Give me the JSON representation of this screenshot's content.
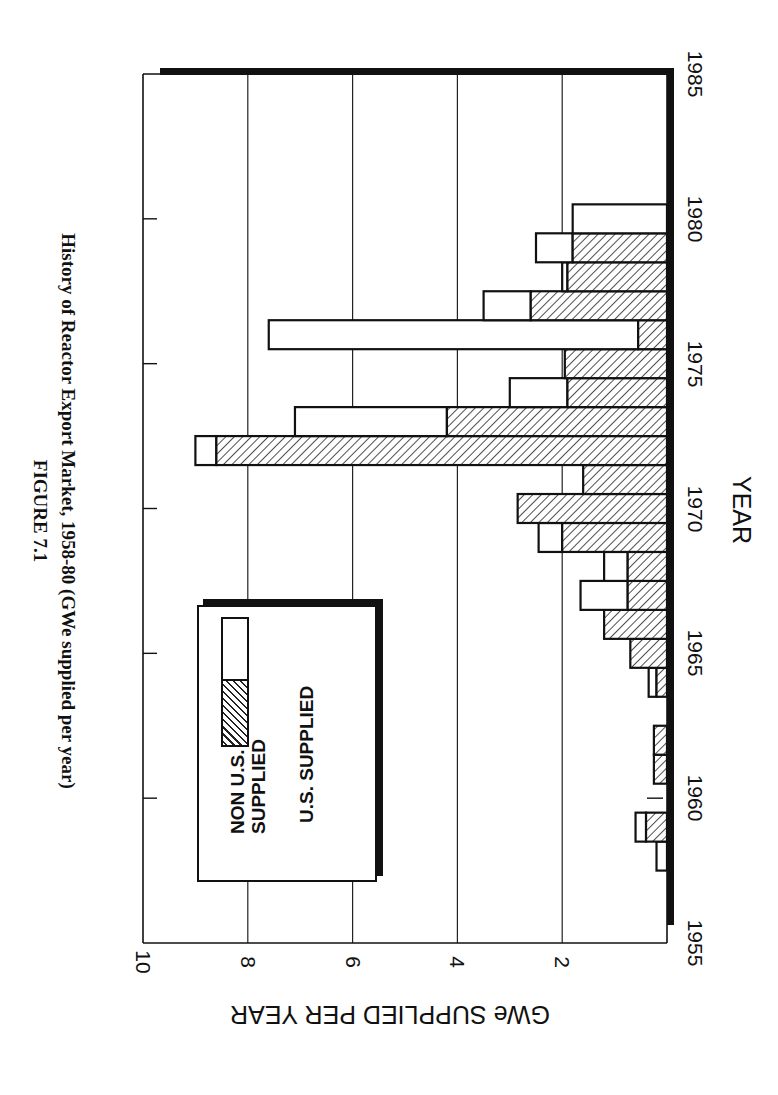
{
  "figure": {
    "label": "FIGURE 7.1",
    "title": "History of Reactor Export Market, 1958-80 (GWe supplied per year)"
  },
  "axes": {
    "value_axis_title": "GWe SUPPLIED PER YEAR",
    "year_axis_title": "YEAR",
    "value_ticks": [
      "10",
      "8",
      "6",
      "4",
      "2"
    ],
    "year_ticks": [
      "1955",
      "1960",
      "1965",
      "1970",
      "1975",
      "1980",
      "1985"
    ]
  },
  "legend": {
    "items": [
      {
        "label_line1": "NON U.S.",
        "label_line2": "SUPPLIED",
        "pattern": "white"
      },
      {
        "label_line1": "U.S. SUPPLIED",
        "label_line2": "",
        "pattern": "hatched"
      }
    ]
  },
  "colors": {
    "ink": "#111111",
    "background": "#ffffff",
    "non_us_fill": "#ffffff",
    "us_hatch": "#222222"
  },
  "chart_data": {
    "type": "bar",
    "orientation": "stacked horizontal bars, figure rotated 90 degrees (years run vertically, values horizontally)",
    "title": "History of Reactor Export Market, 1958-80 (GWe supplied per year)",
    "xlabel": "YEAR",
    "ylabel": "GWe SUPPLIED PER YEAR",
    "xlim": [
      1955,
      1985
    ],
    "ylim": [
      0,
      10
    ],
    "grid": "major gridlines at 2, 4, 6, 8",
    "legend_position": "inside plot, upper-left region",
    "categories": [
      1958,
      1959,
      1960,
      1961,
      1962,
      1963,
      1964,
      1965,
      1966,
      1967,
      1968,
      1969,
      1970,
      1971,
      1972,
      1973,
      1974,
      1975,
      1976,
      1977,
      1978,
      1979,
      1980
    ],
    "series": [
      {
        "name": "U.S. SUPPLIED",
        "pattern": "hatched",
        "values": [
          0,
          0.4,
          0,
          0.25,
          0.25,
          0,
          0.2,
          0.7,
          1.2,
          0.75,
          0.75,
          2.0,
          2.85,
          1.6,
          8.6,
          4.2,
          1.9,
          1.95,
          0.55,
          2.6,
          1.9,
          1.8,
          0
        ]
      },
      {
        "name": "NON U.S. SUPPLIED",
        "pattern": "white",
        "values": [
          0.2,
          0.2,
          0,
          0,
          0,
          0,
          0.15,
          0,
          0,
          0.9,
          0.45,
          0.45,
          0,
          0,
          0.4,
          2.9,
          1.1,
          0,
          7.05,
          0.9,
          0.1,
          0.7,
          1.8
        ]
      }
    ],
    "totals": [
      0.2,
      0.6,
      0,
      0.25,
      0.25,
      0,
      0.35,
      0.7,
      1.2,
      1.65,
      1.2,
      2.45,
      2.85,
      1.6,
      9.0,
      7.1,
      3.0,
      1.95,
      7.6,
      3.5,
      2.0,
      2.5,
      1.8
    ]
  }
}
